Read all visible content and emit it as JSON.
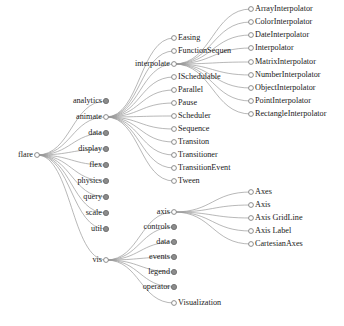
{
  "diagram": {
    "type": "tree",
    "orientation": "left-to-right",
    "colors": {
      "link": "#9a9a9a",
      "node_open_fill": "#ffffff",
      "node_closed_fill": "#8c8c8c",
      "node_stroke": "#808080",
      "label": "#1a1a1a",
      "background": "#ffffff"
    },
    "legend": {
      "open_node": "hollow circle = expanded node",
      "closed_node": "filled circle = collapsed node"
    }
  },
  "nodes": [
    {
      "id": "flare",
      "label": "flare",
      "x": 37,
      "y": 155,
      "state": "open",
      "side": "left",
      "parent": null
    },
    {
      "id": "analytics",
      "label": "analytics",
      "x": 106,
      "y": 101,
      "state": "closed",
      "side": "left",
      "parent": "flare"
    },
    {
      "id": "animate",
      "label": "animate",
      "x": 106,
      "y": 117,
      "state": "open",
      "side": "left",
      "parent": "flare"
    },
    {
      "id": "data",
      "label": "data",
      "x": 106,
      "y": 133,
      "state": "closed",
      "side": "left",
      "parent": "flare"
    },
    {
      "id": "display",
      "label": "display",
      "x": 106,
      "y": 149,
      "state": "closed",
      "side": "left",
      "parent": "flare"
    },
    {
      "id": "flex",
      "label": "flex",
      "x": 106,
      "y": 165,
      "state": "closed",
      "side": "left",
      "parent": "flare"
    },
    {
      "id": "physics",
      "label": "physics",
      "x": 106,
      "y": 181,
      "state": "closed",
      "side": "left",
      "parent": "flare"
    },
    {
      "id": "query",
      "label": "query",
      "x": 106,
      "y": 197,
      "state": "closed",
      "side": "left",
      "parent": "flare"
    },
    {
      "id": "scale",
      "label": "scale",
      "x": 106,
      "y": 213,
      "state": "closed",
      "side": "left",
      "parent": "flare"
    },
    {
      "id": "util",
      "label": "util",
      "x": 106,
      "y": 229,
      "state": "closed",
      "side": "left",
      "parent": "flare"
    },
    {
      "id": "vis",
      "label": "vis",
      "x": 106,
      "y": 260,
      "state": "open",
      "side": "left",
      "parent": "flare"
    },
    {
      "id": "Easing",
      "label": "Easing",
      "x": 174,
      "y": 38,
      "state": "open",
      "side": "right",
      "parent": "animate"
    },
    {
      "id": "FunctionSequence",
      "label": "FunctionSequen",
      "x": 174,
      "y": 51,
      "state": "open",
      "side": "right",
      "parent": "animate"
    },
    {
      "id": "interpolate",
      "label": "interpolate",
      "x": 174,
      "y": 64,
      "state": "open",
      "side": "left",
      "parent": "animate"
    },
    {
      "id": "ISchedulable",
      "label": "ISchedulable",
      "x": 174,
      "y": 77,
      "state": "open",
      "side": "right",
      "parent": "animate"
    },
    {
      "id": "Parallel",
      "label": "Parallel",
      "x": 174,
      "y": 90,
      "state": "open",
      "side": "right",
      "parent": "animate"
    },
    {
      "id": "Pause",
      "label": "Pause",
      "x": 174,
      "y": 103,
      "state": "open",
      "side": "right",
      "parent": "animate"
    },
    {
      "id": "Scheduler",
      "label": "Scheduler",
      "x": 174,
      "y": 116,
      "state": "open",
      "side": "right",
      "parent": "animate"
    },
    {
      "id": "Sequence",
      "label": "Sequence",
      "x": 174,
      "y": 129,
      "state": "open",
      "side": "right",
      "parent": "animate"
    },
    {
      "id": "Transiton",
      "label": "Transiton",
      "x": 174,
      "y": 142,
      "state": "open",
      "side": "right",
      "parent": "animate"
    },
    {
      "id": "Transitioner",
      "label": "Transitioner",
      "x": 174,
      "y": 155,
      "state": "open",
      "side": "right",
      "parent": "animate"
    },
    {
      "id": "TransitionEvent",
      "label": "TransitionEvent",
      "x": 174,
      "y": 168,
      "state": "open",
      "side": "right",
      "parent": "animate"
    },
    {
      "id": "Tween",
      "label": "Tween",
      "x": 174,
      "y": 181,
      "state": "open",
      "side": "right",
      "parent": "animate"
    },
    {
      "id": "ArrayInterpolator",
      "label": "ArrayInterpolator",
      "x": 251,
      "y": 9,
      "state": "open",
      "side": "right",
      "parent": "interpolate"
    },
    {
      "id": "ColorInterpolator",
      "label": "ColorInterpolator",
      "x": 251,
      "y": 22,
      "state": "open",
      "side": "right",
      "parent": "interpolate"
    },
    {
      "id": "DateInterpolator",
      "label": "DateInterpolator",
      "x": 251,
      "y": 35,
      "state": "open",
      "side": "right",
      "parent": "interpolate"
    },
    {
      "id": "Interpolator",
      "label": "Interpolator",
      "x": 251,
      "y": 48,
      "state": "open",
      "side": "right",
      "parent": "interpolate"
    },
    {
      "id": "MatrixInterpolator",
      "label": "MatrixInterpolator",
      "x": 251,
      "y": 62,
      "state": "open",
      "side": "right",
      "parent": "interpolate"
    },
    {
      "id": "NumberInterpolator",
      "label": "NumberInterpolator",
      "x": 251,
      "y": 75,
      "state": "open",
      "side": "right",
      "parent": "interpolate"
    },
    {
      "id": "ObjectInterpolator",
      "label": "ObjectInterpolator",
      "x": 251,
      "y": 88,
      "state": "open",
      "side": "right",
      "parent": "interpolate"
    },
    {
      "id": "PointInterpolator",
      "label": "PointInterpolator",
      "x": 251,
      "y": 101,
      "state": "open",
      "side": "right",
      "parent": "interpolate"
    },
    {
      "id": "RectangleInterpolator",
      "label": "RectangleInterpolator",
      "x": 251,
      "y": 114,
      "state": "open",
      "side": "right",
      "parent": "interpolate"
    },
    {
      "id": "axis",
      "label": "axis",
      "x": 174,
      "y": 212,
      "state": "open",
      "side": "left",
      "parent": "vis"
    },
    {
      "id": "controls",
      "label": "controls",
      "x": 174,
      "y": 227,
      "state": "closed",
      "side": "left",
      "parent": "vis"
    },
    {
      "id": "vis-data",
      "label": "data",
      "x": 174,
      "y": 242,
      "state": "closed",
      "side": "left",
      "parent": "vis"
    },
    {
      "id": "events",
      "label": "events",
      "x": 174,
      "y": 257,
      "state": "closed",
      "side": "left",
      "parent": "vis"
    },
    {
      "id": "legend",
      "label": "legend",
      "x": 174,
      "y": 272,
      "state": "closed",
      "side": "left",
      "parent": "vis"
    },
    {
      "id": "operator",
      "label": "operator",
      "x": 174,
      "y": 287,
      "state": "closed",
      "side": "left",
      "parent": "vis"
    },
    {
      "id": "Visualization",
      "label": "Visualization",
      "x": 174,
      "y": 303,
      "state": "open",
      "side": "right",
      "parent": "vis"
    },
    {
      "id": "Axes",
      "label": "Axes",
      "x": 251,
      "y": 192,
      "state": "open",
      "side": "right",
      "parent": "axis"
    },
    {
      "id": "Axis",
      "label": "Axis",
      "x": 251,
      "y": 205,
      "state": "open",
      "side": "right",
      "parent": "axis"
    },
    {
      "id": "AxisGridLine",
      "label": "Axis GridLine",
      "x": 251,
      "y": 218,
      "state": "open",
      "side": "right",
      "parent": "axis"
    },
    {
      "id": "AxisLabel",
      "label": "Axis Label",
      "x": 251,
      "y": 231,
      "state": "open",
      "side": "right",
      "parent": "axis"
    },
    {
      "id": "CartesianAxes",
      "label": "CartesianAxes",
      "x": 251,
      "y": 244,
      "state": "open",
      "side": "right",
      "parent": "axis"
    }
  ]
}
